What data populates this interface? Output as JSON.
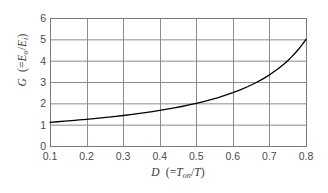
{
  "chart_data": {
    "type": "line",
    "title": "",
    "subtitle": "",
    "xlabel_plain": "D (=Ton/T)",
    "ylabel_plain": "G (=Eo/Ei)",
    "xlabel_parts": {
      "symbol": "D",
      "open": "(=",
      "num_base": "T",
      "num_sub": "on",
      "slash": "/",
      "den": "T",
      "close": ")"
    },
    "ylabel_parts": {
      "symbol": "G",
      "open": "(=",
      "num_base": "E",
      "num_sub": "o",
      "slash": "/",
      "den_base": "E",
      "den_sub": "i",
      "close": ")"
    },
    "xlim": [
      0.1,
      0.8
    ],
    "ylim": [
      0,
      6
    ],
    "xticks": [
      "0.1",
      "0.2",
      "0.3",
      "0.4",
      "0.5",
      "0.6",
      "0.7",
      "0.8"
    ],
    "xtick_values": [
      0.1,
      0.2,
      0.3,
      0.4,
      0.5,
      0.6,
      0.7,
      0.8
    ],
    "yticks": [
      "0",
      "1",
      "2",
      "3",
      "4",
      "5",
      "6"
    ],
    "ytick_values": [
      0,
      1,
      2,
      3,
      4,
      5,
      6
    ],
    "grid": true,
    "grid_color": "#8c8c8c",
    "axis_color": "#7a7a7a",
    "line_color": "#000000",
    "line_width": 1.3,
    "background": "#ffffff",
    "legend": null,
    "legend_position": "none",
    "equation": "G = 1/(1 - D)",
    "x": [
      0.1,
      0.12,
      0.14,
      0.16,
      0.18,
      0.2,
      0.22,
      0.24,
      0.26,
      0.28,
      0.3,
      0.32,
      0.34,
      0.36,
      0.38,
      0.4,
      0.42,
      0.44,
      0.46,
      0.48,
      0.5,
      0.52,
      0.54,
      0.56,
      0.58,
      0.6,
      0.62,
      0.64,
      0.66,
      0.68,
      0.7,
      0.72,
      0.74,
      0.75,
      0.76,
      0.77,
      0.78,
      0.79,
      0.8
    ],
    "values": [
      1.111,
      1.136,
      1.163,
      1.19,
      1.22,
      1.25,
      1.282,
      1.316,
      1.351,
      1.389,
      1.429,
      1.471,
      1.515,
      1.563,
      1.613,
      1.667,
      1.724,
      1.786,
      1.852,
      1.923,
      2.0,
      2.083,
      2.174,
      2.273,
      2.381,
      2.5,
      2.632,
      2.778,
      2.941,
      3.125,
      3.333,
      3.571,
      3.846,
      4.0,
      4.167,
      4.348,
      4.545,
      4.762,
      5.0
    ],
    "series": [
      {
        "name": "G = 1/(1 - D)",
        "x": [
          0.1,
          0.12,
          0.14,
          0.16,
          0.18,
          0.2,
          0.22,
          0.24,
          0.26,
          0.28,
          0.3,
          0.32,
          0.34,
          0.36,
          0.38,
          0.4,
          0.42,
          0.44,
          0.46,
          0.48,
          0.5,
          0.52,
          0.54,
          0.56,
          0.58,
          0.6,
          0.62,
          0.64,
          0.66,
          0.68,
          0.7,
          0.72,
          0.74,
          0.75,
          0.76,
          0.77,
          0.78,
          0.79,
          0.8
        ],
        "values": [
          1.111,
          1.136,
          1.163,
          1.19,
          1.22,
          1.25,
          1.282,
          1.316,
          1.351,
          1.389,
          1.429,
          1.471,
          1.515,
          1.563,
          1.613,
          1.667,
          1.724,
          1.786,
          1.852,
          1.923,
          2.0,
          2.083,
          2.174,
          2.273,
          2.381,
          2.5,
          2.632,
          2.778,
          2.941,
          3.125,
          3.333,
          3.571,
          3.846,
          4.0,
          4.167,
          4.348,
          4.545,
          4.762,
          5.0
        ]
      }
    ],
    "annotations": []
  },
  "plot_geometry": {
    "left": 50,
    "top": 18,
    "right": 306,
    "bottom": 146
  }
}
